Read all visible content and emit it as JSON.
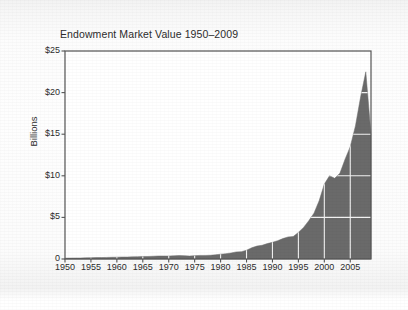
{
  "figure": {
    "background_color": "#f7f7f7",
    "plot_background_color": "#ffffff",
    "frame_color": "#555555"
  },
  "chart_data": {
    "type": "area",
    "title": "Endowment Market Value 1950–2009",
    "xlabel": "",
    "ylabel": "Billions",
    "xlim": [
      1950,
      2009
    ],
    "ylim": [
      0,
      25
    ],
    "grid": true,
    "legend": null,
    "fill_color": "#6a6a6a",
    "gridline_color": "#f2f2f2",
    "y_ticks": [
      0,
      5,
      10,
      15,
      20,
      25
    ],
    "y_tick_labels": [
      "0",
      "$5",
      "$10",
      "$15",
      "$20",
      "$25"
    ],
    "x_ticks": [
      1950,
      1955,
      1960,
      1965,
      1970,
      1975,
      1980,
      1985,
      1990,
      1995,
      2000,
      2005
    ],
    "x_tick_labels": [
      "1950",
      "1955",
      "1960",
      "1965",
      "1970",
      "1975",
      "1980",
      "1985",
      "1990",
      "1995",
      "2000",
      "2005"
    ],
    "units": "Billions of dollars",
    "x": [
      1950,
      1951,
      1952,
      1953,
      1954,
      1955,
      1956,
      1957,
      1958,
      1959,
      1960,
      1961,
      1962,
      1963,
      1964,
      1965,
      1966,
      1967,
      1968,
      1969,
      1970,
      1971,
      1972,
      1973,
      1974,
      1975,
      1976,
      1977,
      1978,
      1979,
      1980,
      1981,
      1982,
      1983,
      1984,
      1985,
      1986,
      1987,
      1988,
      1989,
      1990,
      1991,
      1992,
      1993,
      1994,
      1995,
      1996,
      1997,
      1998,
      1999,
      2000,
      2001,
      2002,
      2003,
      2004,
      2005,
      2006,
      2007,
      2008,
      2009
    ],
    "values": [
      0.1,
      0.11,
      0.12,
      0.12,
      0.14,
      0.16,
      0.17,
      0.17,
      0.19,
      0.21,
      0.22,
      0.24,
      0.24,
      0.26,
      0.28,
      0.3,
      0.3,
      0.33,
      0.36,
      0.36,
      0.35,
      0.38,
      0.41,
      0.4,
      0.35,
      0.4,
      0.43,
      0.43,
      0.45,
      0.5,
      0.58,
      0.64,
      0.72,
      0.85,
      0.88,
      1.05,
      1.35,
      1.55,
      1.65,
      1.85,
      2.0,
      2.2,
      2.45,
      2.65,
      2.7,
      3.2,
      3.8,
      4.6,
      5.5,
      7.0,
      9.0,
      10.0,
      9.7,
      10.3,
      12.0,
      13.5,
      16.0,
      19.5,
      22.5,
      15.0
    ],
    "annotations": [
      {
        "label": "peak",
        "x": 2008,
        "y": 22.5
      },
      {
        "label": "plateau",
        "x": 2002,
        "y": 9.7
      },
      {
        "label": "final-decline",
        "x": 2009,
        "y": 15.0
      }
    ]
  }
}
